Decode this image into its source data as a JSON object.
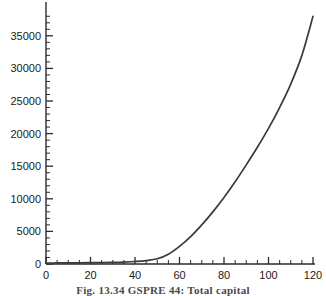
{
  "figure": {
    "caption": "Fig. 13.34 GSPRE 44: Total capital"
  },
  "chart_data": {
    "type": "line",
    "title": "",
    "xlabel": "",
    "ylabel": "",
    "xlim": [
      0,
      120
    ],
    "ylim": [
      0,
      38500
    ],
    "grid": false,
    "legend": null,
    "x_ticks": [
      0,
      20,
      40,
      60,
      80,
      100,
      120
    ],
    "x_tick_labels": [
      "0",
      "20",
      "40",
      "60",
      "80",
      "100",
      "120"
    ],
    "x_minor_step": 5,
    "y_ticks": [
      0,
      5000,
      10000,
      15000,
      20000,
      25000,
      30000,
      35000
    ],
    "y_tick_labels": [
      "0",
      "5000",
      "10000",
      "15000",
      "20000",
      "25000",
      "30000",
      "35000"
    ],
    "y_minor_step": 1000,
    "series": [
      {
        "name": "Total capital",
        "color": "#3a3a3a",
        "x": [
          0,
          5,
          10,
          15,
          20,
          25,
          30,
          35,
          40,
          45,
          50,
          55,
          60,
          65,
          70,
          75,
          80,
          85,
          90,
          95,
          100,
          105,
          110,
          115,
          120
        ],
        "values": [
          150,
          160,
          170,
          185,
          200,
          220,
          250,
          300,
          380,
          520,
          800,
          1500,
          2700,
          4200,
          6000,
          8000,
          10200,
          12600,
          15200,
          17900,
          20800,
          24000,
          27600,
          32000,
          38000
        ]
      }
    ]
  }
}
